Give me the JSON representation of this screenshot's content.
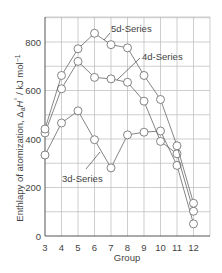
{
  "chart_data": {
    "type": "line",
    "title": "",
    "xlabel": "Group",
    "ylabel": "Enthlapy of atomization, ΔaH° / kJ mol⁻¹",
    "ylabel_parts": {
      "main": "Enthlapy of atomization, Δ",
      "sub": "a",
      "italic": "H",
      "sup_deg": "°",
      "unit": " / kJ mol",
      "unit_sup": "−1"
    },
    "x": [
      3,
      4,
      5,
      6,
      7,
      8,
      9,
      10,
      11,
      12
    ],
    "categories": [
      "3",
      "4",
      "5",
      "6",
      "7",
      "8",
      "9",
      "10",
      "11",
      "12"
    ],
    "xlim": [
      3,
      13.3
    ],
    "ylim": [
      0,
      900
    ],
    "yticks": [
      0,
      200,
      400,
      600,
      800
    ],
    "ytick_labels": [
      "0",
      "200",
      "400",
      "600",
      "800"
    ],
    "grid": true,
    "grid_y_step": 100,
    "legend": "inline annotations",
    "series": [
      {
        "name": "3d-Series",
        "values": [
          334,
          466,
          516,
          397,
          281,
          417,
          428,
          433,
          291,
          50
        ]
      },
      {
        "name": "4d-Series",
        "values": [
          425,
          607,
          720,
          654,
          648,
          634,
          556,
          390,
          339,
          102
        ]
      },
      {
        "name": "5d-Series",
        "values": [
          441,
          662,
          772,
          836,
          789,
          776,
          662,
          563,
          372,
          135
        ]
      }
    ],
    "annotations": [
      {
        "text": "5d-Series",
        "series": "5d-Series"
      },
      {
        "text": "4d-Series",
        "series": "4d-Series"
      },
      {
        "text": "3d-Series",
        "series": "3d-Series"
      }
    ]
  }
}
